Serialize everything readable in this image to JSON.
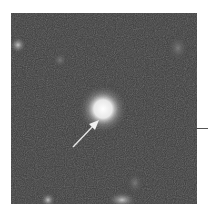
{
  "figure": {
    "colors": {
      "background": "#3a3a3a",
      "source": "#ffffff",
      "arrow": "#e6e6e6"
    },
    "sources": [
      {
        "name": "central-bright-source",
        "brightness": 1.0
      },
      {
        "name": "faint-source-upper-left",
        "brightness": 0.55
      },
      {
        "name": "faint-source-upper-middle",
        "brightness": 0.3
      },
      {
        "name": "faint-source-upper-right",
        "brightness": 0.35
      },
      {
        "name": "faint-source-bottom-left",
        "brightness": 0.6
      },
      {
        "name": "faint-source-bottom-middle",
        "brightness": 0.55
      },
      {
        "name": "faint-source-bottom-right",
        "brightness": 0.4
      }
    ],
    "arrow": {
      "points_to": "central-bright-source"
    }
  }
}
